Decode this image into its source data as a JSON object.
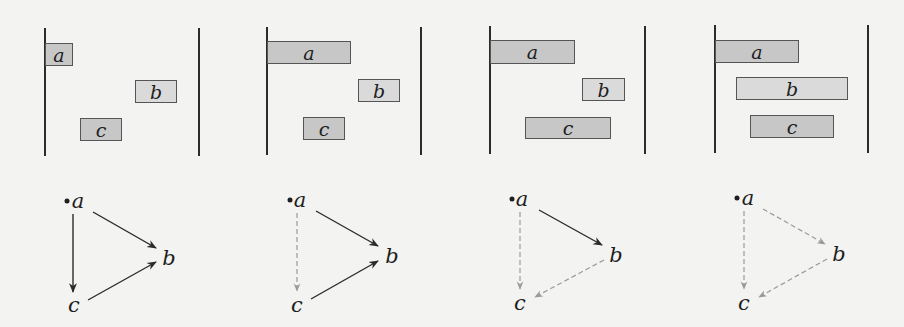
{
  "colors": {
    "background": "#f3f3f2",
    "line": "#2b2b2b",
    "box_border": "#555555",
    "box_fill_dark": "#c7c7c7",
    "box_fill_light": "#dadada",
    "edge_solid": "#2b2b2b",
    "edge_dashed": "#9a9a9a"
  },
  "panels": [
    {
      "lines": {
        "left_x": 45,
        "right_x": 199,
        "top": 28,
        "bottom": 156
      },
      "boxes": [
        {
          "label": "a",
          "x": 45,
          "y": 43,
          "w": 28,
          "h": 23,
          "shade": "dark"
        },
        {
          "label": "b",
          "x": 135,
          "y": 80,
          "w": 42,
          "h": 23,
          "shade": "light"
        },
        {
          "label": "c",
          "x": 80,
          "y": 118,
          "w": 42,
          "h": 23,
          "shade": "dark"
        }
      ],
      "graph": {
        "root_dot": {
          "x": 67,
          "y": 201
        },
        "nodes": [
          {
            "label": "a",
            "x": 78,
            "y": 201
          },
          {
            "label": "b",
            "x": 169,
            "y": 258
          },
          {
            "label": "c",
            "x": 74,
            "y": 305
          }
        ],
        "edges": [
          {
            "from": "a",
            "to": "c",
            "style": "solid",
            "x1": 73,
            "y1": 214,
            "x2": 73,
            "y2": 292
          },
          {
            "from": "a",
            "to": "b",
            "style": "solid",
            "x1": 93,
            "y1": 212,
            "x2": 156,
            "y2": 248
          },
          {
            "from": "c",
            "to": "b",
            "style": "solid",
            "x1": 88,
            "y1": 300,
            "x2": 156,
            "y2": 262
          }
        ]
      }
    },
    {
      "lines": {
        "left_x": 267,
        "right_x": 421,
        "top": 27,
        "bottom": 155
      },
      "boxes": [
        {
          "label": "a",
          "x": 267,
          "y": 41,
          "w": 84,
          "h": 23,
          "shade": "dark"
        },
        {
          "label": "b",
          "x": 358,
          "y": 79,
          "w": 42,
          "h": 23,
          "shade": "light"
        },
        {
          "label": "c",
          "x": 303,
          "y": 117,
          "w": 42,
          "h": 23,
          "shade": "dark"
        }
      ],
      "graph": {
        "root_dot": {
          "x": 290,
          "y": 200
        },
        "nodes": [
          {
            "label": "a",
            "x": 300,
            "y": 200
          },
          {
            "label": "b",
            "x": 392,
            "y": 256
          },
          {
            "label": "c",
            "x": 297,
            "y": 305
          }
        ],
        "edges": [
          {
            "from": "a",
            "to": "c",
            "style": "dashed",
            "x1": 297,
            "y1": 213,
            "x2": 297,
            "y2": 291
          },
          {
            "from": "a",
            "to": "b",
            "style": "solid",
            "x1": 316,
            "y1": 211,
            "x2": 378,
            "y2": 246
          },
          {
            "from": "c",
            "to": "b",
            "style": "solid",
            "x1": 311,
            "y1": 299,
            "x2": 378,
            "y2": 261
          }
        ]
      }
    },
    {
      "lines": {
        "left_x": 490,
        "right_x": 645,
        "top": 26,
        "bottom": 154
      },
      "boxes": [
        {
          "label": "a",
          "x": 490,
          "y": 40,
          "w": 85,
          "h": 24,
          "shade": "dark"
        },
        {
          "label": "b",
          "x": 582,
          "y": 78,
          "w": 43,
          "h": 23,
          "shade": "light"
        },
        {
          "label": "c",
          "x": 525,
          "y": 117,
          "w": 86,
          "h": 22,
          "shade": "dark"
        }
      ],
      "graph": {
        "root_dot": {
          "x": 512,
          "y": 199
        },
        "nodes": [
          {
            "label": "a",
            "x": 522,
            "y": 199
          },
          {
            "label": "b",
            "x": 616,
            "y": 255
          },
          {
            "label": "c",
            "x": 520,
            "y": 303
          }
        ],
        "edges": [
          {
            "from": "a",
            "to": "c",
            "style": "dashed",
            "x1": 520,
            "y1": 212,
            "x2": 520,
            "y2": 289
          },
          {
            "from": "a",
            "to": "b",
            "style": "solid",
            "x1": 539,
            "y1": 210,
            "x2": 602,
            "y2": 245
          },
          {
            "from": "b",
            "to": "c",
            "style": "dashed",
            "x1": 604,
            "y1": 260,
            "x2": 535,
            "y2": 297
          }
        ]
      }
    },
    {
      "lines": {
        "left_x": 715,
        "right_x": 868,
        "top": 25,
        "bottom": 153
      },
      "boxes": [
        {
          "label": "a",
          "x": 715,
          "y": 40,
          "w": 84,
          "h": 23,
          "shade": "dark"
        },
        {
          "label": "b",
          "x": 736,
          "y": 77,
          "w": 112,
          "h": 23,
          "shade": "light"
        },
        {
          "label": "c",
          "x": 750,
          "y": 115,
          "w": 84,
          "h": 23,
          "shade": "dark"
        }
      ],
      "graph": {
        "root_dot": {
          "x": 737,
          "y": 198
        },
        "nodes": [
          {
            "label": "a",
            "x": 748,
            "y": 198
          },
          {
            "label": "b",
            "x": 839,
            "y": 254
          },
          {
            "label": "c",
            "x": 744,
            "y": 303
          }
        ],
        "edges": [
          {
            "from": "a",
            "to": "c",
            "style": "dashed",
            "x1": 744,
            "y1": 211,
            "x2": 744,
            "y2": 289
          },
          {
            "from": "a",
            "to": "b",
            "style": "dashed",
            "x1": 763,
            "y1": 209,
            "x2": 825,
            "y2": 244
          },
          {
            "from": "b",
            "to": "c",
            "style": "dashed",
            "x1": 827,
            "y1": 259,
            "x2": 759,
            "y2": 297
          }
        ]
      }
    }
  ]
}
